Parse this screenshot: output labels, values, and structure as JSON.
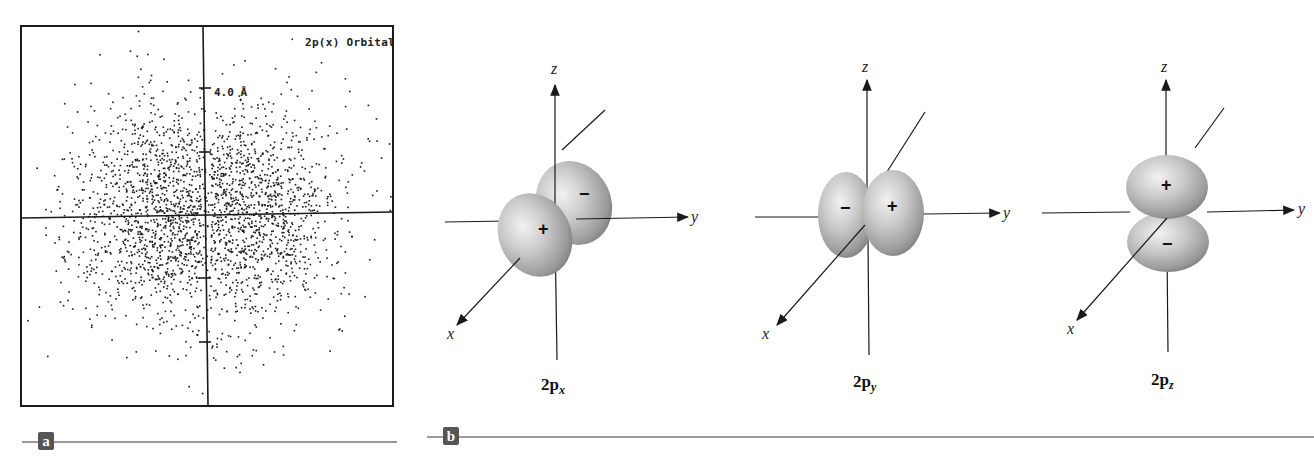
{
  "panel_a": {
    "label": "a",
    "title": "2p(x) Orbital",
    "scale_label": "4.0 Å",
    "scatter": {
      "clusters": [
        {
          "cx": 160,
          "cy": 214,
          "sx": 52,
          "sy": 62,
          "count": 1300
        },
        {
          "cx": 248,
          "cy": 214,
          "sx": 55,
          "sy": 62,
          "count": 1300
        }
      ],
      "dot_color": "#1a1a1a",
      "seed": 7
    },
    "ticks_y": [
      88,
      152,
      278,
      342
    ]
  },
  "panel_b": {
    "label": "b",
    "orbitals": [
      {
        "id": "2px",
        "caption_main": "2p",
        "caption_sub": "x",
        "pos_sign": "+",
        "neg_sign": "−"
      },
      {
        "id": "2py",
        "caption_main": "2p",
        "caption_sub": "y",
        "pos_sign": "+",
        "neg_sign": "−"
      },
      {
        "id": "2pz",
        "caption_main": "2p",
        "caption_sub": "z",
        "pos_sign": "+",
        "neg_sign": "−"
      }
    ],
    "axis_labels": {
      "x": "x",
      "y": "y",
      "z": "z"
    }
  },
  "colors": {
    "lobe_light": "#e6e6e6",
    "lobe_mid": "#b8b8b8",
    "lobe_dark": "#8a8a8a",
    "badge": "#555555",
    "rule": "#9a9a9a",
    "axis": "#1a1a1a"
  }
}
